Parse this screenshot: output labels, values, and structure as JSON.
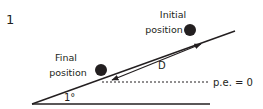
{
  "figure": {
    "number": "1",
    "initial_label_line1": "Initial",
    "initial_label_line2": "position",
    "final_label_line1": "Final",
    "final_label_line2": "position",
    "displacement_label": "D",
    "reference_label": "p.e. = 0",
    "angle_label": "1°"
  },
  "colors": {
    "ink": "#231f20",
    "background": "#ffffff"
  }
}
